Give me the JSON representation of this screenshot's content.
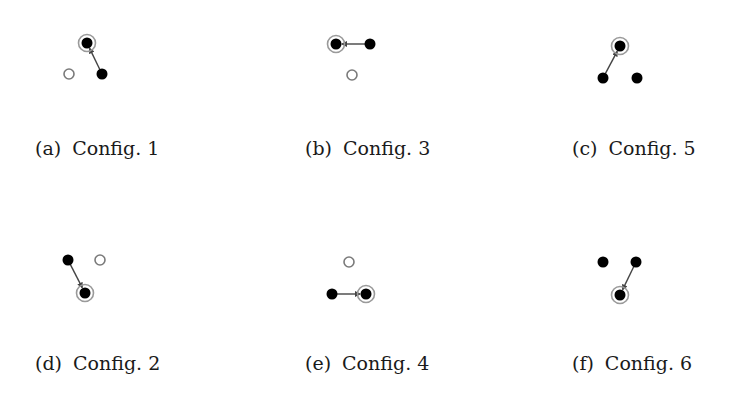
{
  "figure": {
    "colors": {
      "node_fill": "#000000",
      "open_node_stroke": "#7a7a7a",
      "ring_stroke": "#9a9a9a",
      "edge": "#444444",
      "background": "#ffffff"
    },
    "panels": [
      {
        "id": "a",
        "label": "(a)",
        "title": "Config. 1",
        "caption_pos": [
          35,
          137
        ],
        "nodes": [
          {
            "x": 87,
            "y": 43,
            "type": "filled",
            "ring": true
          },
          {
            "x": 102,
            "y": 74,
            "type": "filled",
            "ring": false
          },
          {
            "x": 69,
            "y": 74,
            "type": "open",
            "ring": false
          }
        ],
        "edge": {
          "from": [
            102,
            74
          ],
          "to": [
            87,
            43
          ]
        }
      },
      {
        "id": "b",
        "label": "(b)",
        "title": "Config. 3",
        "caption_pos": [
          305,
          137
        ],
        "nodes": [
          {
            "x": 336,
            "y": 44,
            "type": "filled",
            "ring": true
          },
          {
            "x": 370,
            "y": 44,
            "type": "filled",
            "ring": false
          },
          {
            "x": 352,
            "y": 75,
            "type": "open",
            "ring": false
          }
        ],
        "edge": {
          "from": [
            370,
            44
          ],
          "to": [
            336,
            44
          ]
        }
      },
      {
        "id": "c",
        "label": "(c)",
        "title": "Config. 5",
        "caption_pos": [
          572,
          137
        ],
        "nodes": [
          {
            "x": 620,
            "y": 46,
            "type": "filled",
            "ring": true
          },
          {
            "x": 603,
            "y": 78,
            "type": "filled",
            "ring": false
          },
          {
            "x": 637,
            "y": 78,
            "type": "filled",
            "ring": false
          }
        ],
        "edge": {
          "from": [
            603,
            78
          ],
          "to": [
            620,
            46
          ]
        }
      },
      {
        "id": "d",
        "label": "(d)",
        "title": "Config. 2",
        "caption_pos": [
          35,
          352
        ],
        "nodes": [
          {
            "x": 68,
            "y": 260,
            "type": "filled",
            "ring": false
          },
          {
            "x": 100,
            "y": 260,
            "type": "open",
            "ring": false
          },
          {
            "x": 85,
            "y": 293,
            "type": "filled",
            "ring": true
          }
        ],
        "edge": {
          "from": [
            68,
            260
          ],
          "to": [
            85,
            293
          ]
        }
      },
      {
        "id": "e",
        "label": "(e)",
        "title": "Config. 4",
        "caption_pos": [
          305,
          352
        ],
        "nodes": [
          {
            "x": 349,
            "y": 262,
            "type": "open",
            "ring": false
          },
          {
            "x": 332,
            "y": 294,
            "type": "filled",
            "ring": false
          },
          {
            "x": 366,
            "y": 294,
            "type": "filled",
            "ring": true
          }
        ],
        "edge": {
          "from": [
            332,
            294
          ],
          "to": [
            366,
            294
          ]
        }
      },
      {
        "id": "f",
        "label": "(f)",
        "title": "Config. 6",
        "caption_pos": [
          572,
          352
        ],
        "nodes": [
          {
            "x": 603,
            "y": 262,
            "type": "filled",
            "ring": false
          },
          {
            "x": 636,
            "y": 262,
            "type": "filled",
            "ring": false
          },
          {
            "x": 620,
            "y": 295,
            "type": "filled",
            "ring": true
          }
        ],
        "edge": {
          "from": [
            636,
            262
          ],
          "to": [
            620,
            295
          ]
        }
      }
    ]
  }
}
